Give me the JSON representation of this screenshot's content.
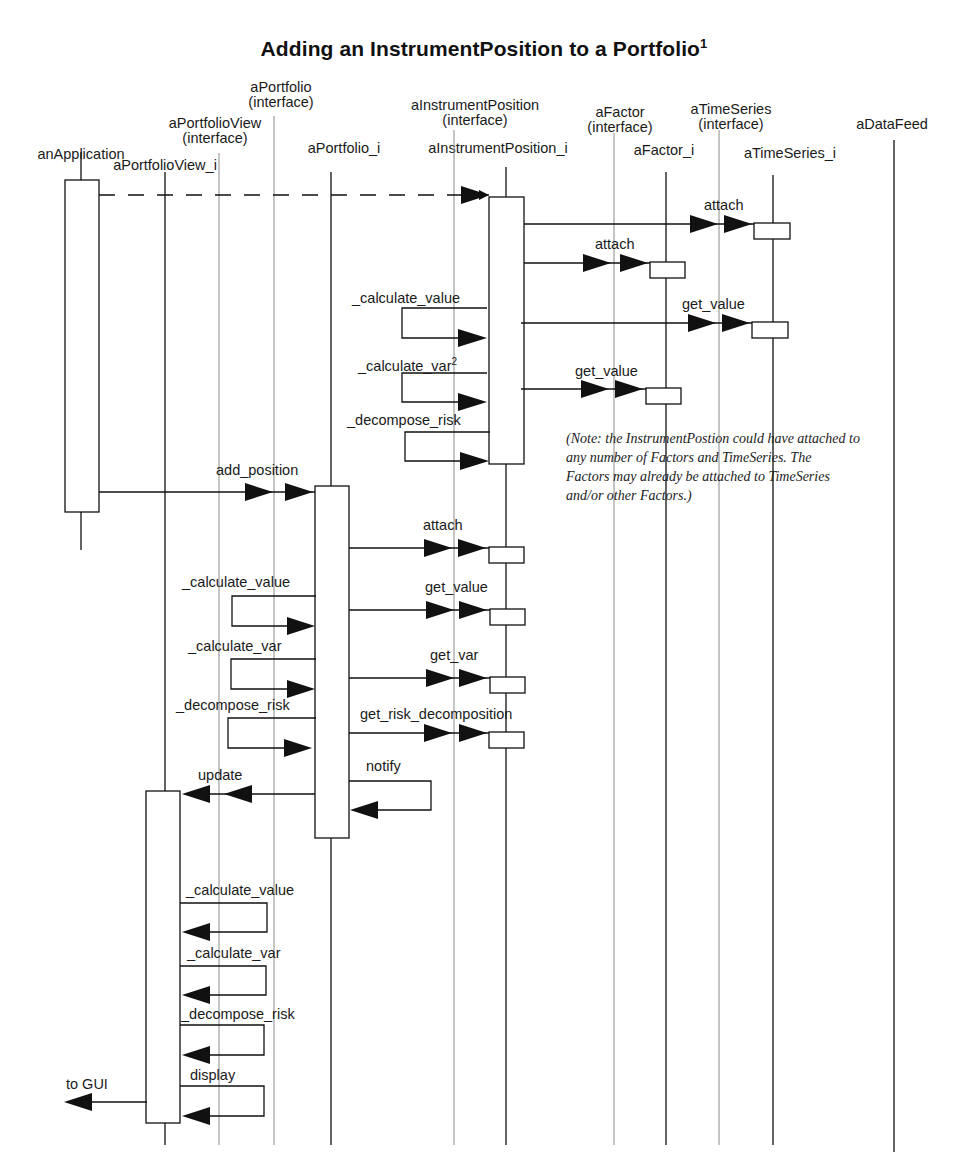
{
  "diagram": {
    "title": "Adding an InstrumentPosition to a Portfolio",
    "title_footnote": "1",
    "type": "UML sequence diagram",
    "lifelines": [
      {
        "id": "anApplication",
        "label": "anApplication",
        "x": 81,
        "style": "object"
      },
      {
        "id": "aPortfolioView_i",
        "label": "aPortfolioView_i",
        "x": 165,
        "style": "object"
      },
      {
        "id": "aPortfolioView_if",
        "label": "aPortfolioView",
        "sublabel": "(interface)",
        "x": 219,
        "style": "interface"
      },
      {
        "id": "aPortfolio_if",
        "label": "aPortfolio",
        "sublabel": "(interface)",
        "x": 274,
        "style": "interface"
      },
      {
        "id": "aPortfolio_i",
        "label": "aPortfolio_i",
        "x": 331,
        "style": "object"
      },
      {
        "id": "aInstrumentPosition_if",
        "label": "aInstrumentPosition",
        "sublabel": "(interface)",
        "x": 454,
        "style": "interface"
      },
      {
        "id": "aInstrumentPosition_i",
        "label": "aInstrumentPosition_i",
        "x": 506,
        "style": "object"
      },
      {
        "id": "aFactor_if",
        "label": "aFactor",
        "sublabel": "(interface)",
        "x": 614,
        "style": "interface"
      },
      {
        "id": "aFactor_i",
        "label": "aFactor_i",
        "x": 667,
        "style": "object"
      },
      {
        "id": "aTimeSeries_if",
        "label": "aTimeSeries",
        "sublabel": "(interface)",
        "x": 719,
        "style": "interface"
      },
      {
        "id": "aTimeSeries_i",
        "label": "aTimeSeries_i",
        "x": 773,
        "style": "object"
      },
      {
        "id": "aDataFeed",
        "label": "aDataFeed",
        "x": 894,
        "style": "object"
      }
    ],
    "messages": {
      "create_instrument_position": {
        "label": "",
        "from": "anApplication",
        "to": "aInstrumentPosition_i",
        "style": "dashed"
      },
      "ip_attach_timeseries": {
        "label": "attach",
        "from": "aInstrumentPosition_i",
        "to": "aTimeSeries_i"
      },
      "ip_attach_factor": {
        "label": "attach",
        "from": "aInstrumentPosition_i",
        "to": "aFactor_i"
      },
      "ip_calculate_value": {
        "label": "_calculate_value",
        "from": "aInstrumentPosition_i",
        "to": "aInstrumentPosition_i",
        "style": "self"
      },
      "ip_get_value_timeseries": {
        "label": "get_value",
        "from": "aInstrumentPosition_i",
        "to": "aTimeSeries_i"
      },
      "ip_calculate_var": {
        "label": "_calculate_var",
        "footnote": "2",
        "from": "aInstrumentPosition_i",
        "to": "aInstrumentPosition_i",
        "style": "self"
      },
      "ip_get_value_factor": {
        "label": "get_value",
        "from": "aInstrumentPosition_i",
        "to": "aFactor_i"
      },
      "ip_decompose_risk": {
        "label": "_decompose_risk",
        "from": "aInstrumentPosition_i",
        "to": "aInstrumentPosition_i",
        "style": "self"
      },
      "add_position": {
        "label": "add_position",
        "from": "anApplication",
        "to": "aPortfolio_i"
      },
      "pf_attach": {
        "label": "attach",
        "from": "aPortfolio_i",
        "to": "aInstrumentPosition_i"
      },
      "pf_calculate_value": {
        "label": "_calculate_value",
        "from": "aPortfolio_i",
        "to": "aPortfolio_i",
        "style": "self"
      },
      "pf_get_value": {
        "label": "get_value",
        "from": "aPortfolio_i",
        "to": "aInstrumentPosition_i"
      },
      "pf_calculate_var": {
        "label": "_calculate_var",
        "from": "aPortfolio_i",
        "to": "aPortfolio_i",
        "style": "self"
      },
      "pf_get_var": {
        "label": "get_var",
        "from": "aPortfolio_i",
        "to": "aInstrumentPosition_i"
      },
      "pf_decompose_risk": {
        "label": "_decompose_risk",
        "from": "aPortfolio_i",
        "to": "aPortfolio_i",
        "style": "self"
      },
      "pf_get_risk_decomposition": {
        "label": "get_risk_decomposition",
        "from": "aPortfolio_i",
        "to": "aInstrumentPosition_i"
      },
      "pf_notify": {
        "label": "notify",
        "from": "aPortfolio_i",
        "to": "aPortfolio_i",
        "style": "self"
      },
      "update": {
        "label": "update",
        "from": "aPortfolio_i",
        "to": "aPortfolioView_i"
      },
      "pv_calculate_value": {
        "label": "_calculate_value",
        "from": "aPortfolioView_i",
        "to": "aPortfolioView_i",
        "style": "self"
      },
      "pv_calculate_var": {
        "label": "_calculate_var",
        "from": "aPortfolioView_i",
        "to": "aPortfolioView_i",
        "style": "self"
      },
      "pv_decompose_risk": {
        "label": "_decompose_risk",
        "from": "aPortfolioView_i",
        "to": "aPortfolioView_i",
        "style": "self"
      },
      "pv_display": {
        "label": "display",
        "from": "aPortfolioView_i",
        "to": "aPortfolioView_i",
        "style": "self"
      },
      "to_gui": {
        "label": "to GUI",
        "from": "aPortfolioView_i",
        "to": "outside"
      }
    },
    "note": {
      "lines": [
        "(Note: the InstrumentPostion could have attached to",
        " any number of Factors and TimeSeries. The",
        "Factors may already be attached to TimeSeries",
        "and/or other Factors.)"
      ]
    },
    "colors": {
      "line": "#111111",
      "interface_line": "#8a8a8a",
      "background": "#ffffff"
    }
  }
}
